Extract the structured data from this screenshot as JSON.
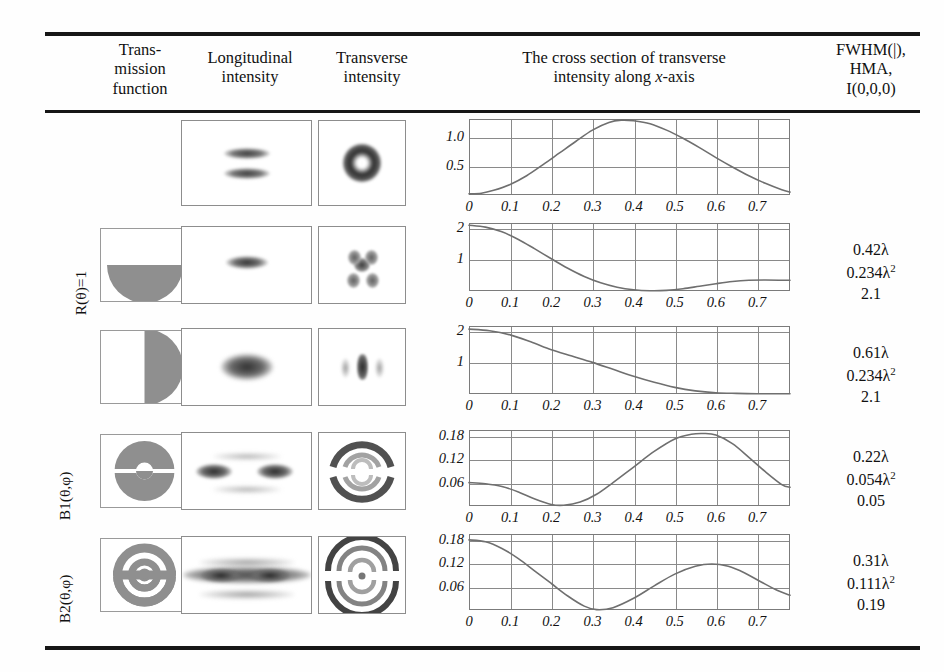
{
  "table": {
    "headers": [
      {
        "id": "transmission",
        "lines": [
          "Trans-",
          "mission",
          "function"
        ]
      },
      {
        "id": "longitudinal",
        "lines": [
          "Longitudinal",
          "intensity"
        ]
      },
      {
        "id": "transverse",
        "lines": [
          "Transverse",
          "intensity"
        ]
      },
      {
        "id": "cross-section",
        "lines": [
          "The cross section of transverse",
          "intensity along  x-axis"
        ]
      },
      {
        "id": "metrics",
        "lines": [
          "FWHM(|),",
          "HMA,",
          "I(0,0,0)"
        ]
      }
    ],
    "row_labels": [
      {
        "id": "r-theta",
        "text": "R(θ)=1",
        "rows": [
          1,
          2
        ]
      },
      {
        "id": "b1",
        "text": "B1(θ,φ)",
        "rows": [
          3
        ]
      },
      {
        "id": "b2",
        "text": "B2(θ,φ)",
        "rows": [
          4
        ]
      }
    ],
    "rows": [
      {
        "id": "row-1",
        "transmission_function": "",
        "longitudinal": "two-horizontal-lobes",
        "transverse": "ring-spot",
        "metrics": {
          "fwhm": "",
          "hma": "",
          "i000": ""
        }
      },
      {
        "id": "row-2",
        "transmission_function": "bottom-semicircle",
        "longitudinal": "single-narrow-lobe",
        "transverse": "four-lobe-cluster",
        "metrics": {
          "fwhm": "0.42λ",
          "hma_base": "0.234λ",
          "hma_exp": "2",
          "i000": "2.1"
        }
      },
      {
        "id": "row-3",
        "transmission_function": "right-semicircle",
        "longitudinal": "single-broad-lobe",
        "transverse": "vertical-bar-spot",
        "metrics": {
          "fwhm": "0.61λ",
          "hma_base": "0.234λ",
          "hma_exp": "2",
          "i000": "2.1"
        }
      },
      {
        "id": "row-4",
        "transmission_function": "split-annulus",
        "longitudinal": "twin-lobes",
        "transverse": "concentric-arcs",
        "metrics": {
          "fwhm": "0.22λ",
          "hma_base": "0.054λ",
          "hma_exp": "2",
          "i000": "0.05"
        }
      },
      {
        "id": "row-5",
        "transmission_function": "split-double-annulus",
        "longitudinal": "broad-twin-lobes",
        "transverse": "concentric-arcs-double",
        "metrics": {
          "fwhm": "0.31λ",
          "hma_base": "0.111λ",
          "hma_exp": "2",
          "i000": "0.19"
        }
      }
    ]
  },
  "chart_data": [
    {
      "id": "chart-row-1",
      "type": "line",
      "title": "",
      "xlabel": "",
      "ylabel": "",
      "xlim": [
        0,
        0.78
      ],
      "ylim": [
        0,
        1.3
      ],
      "xticks": [
        0,
        0.1,
        0.2,
        0.3,
        0.4,
        0.5,
        0.6,
        0.7
      ],
      "xticklabels": [
        "0",
        "0.1",
        "0.2",
        "0.3",
        "0.4",
        "0.5",
        "0.6",
        "0.7"
      ],
      "yticks": [
        0.5,
        1.0
      ],
      "yticklabels": [
        "0.5",
        "1.0"
      ],
      "grid": true,
      "series": [
        {
          "name": "cross-section",
          "x": [
            0.0,
            0.03,
            0.06,
            0.1,
            0.14,
            0.18,
            0.22,
            0.26,
            0.3,
            0.34,
            0.37,
            0.4,
            0.44,
            0.48,
            0.52,
            0.56,
            0.6,
            0.64,
            0.68,
            0.72,
            0.76,
            0.78
          ],
          "y": [
            0.02,
            0.03,
            0.08,
            0.18,
            0.33,
            0.52,
            0.72,
            0.92,
            1.11,
            1.24,
            1.28,
            1.27,
            1.22,
            1.11,
            0.97,
            0.81,
            0.64,
            0.48,
            0.33,
            0.2,
            0.09,
            0.05
          ]
        }
      ]
    },
    {
      "id": "chart-row-2",
      "type": "line",
      "title": "",
      "xlabel": "",
      "ylabel": "",
      "xlim": [
        0,
        0.78
      ],
      "ylim": [
        0,
        2.15
      ],
      "xticks": [
        0,
        0.1,
        0.2,
        0.3,
        0.4,
        0.5,
        0.6,
        0.7
      ],
      "xticklabels": [
        "0",
        "0.1",
        "0.2",
        "0.3",
        "0.4",
        "0.5",
        "0.6",
        "0.7"
      ],
      "yticks": [
        1,
        2
      ],
      "yticklabels": [
        "1",
        "2"
      ],
      "grid": true,
      "series": [
        {
          "name": "cross-section",
          "x": [
            0.0,
            0.04,
            0.08,
            0.12,
            0.16,
            0.2,
            0.24,
            0.28,
            0.32,
            0.36,
            0.4,
            0.44,
            0.48,
            0.52,
            0.56,
            0.6,
            0.64,
            0.68,
            0.72,
            0.78
          ],
          "y": [
            2.08,
            2.02,
            1.87,
            1.63,
            1.33,
            1.02,
            0.72,
            0.46,
            0.26,
            0.12,
            0.04,
            0.01,
            0.02,
            0.07,
            0.15,
            0.23,
            0.3,
            0.34,
            0.35,
            0.34
          ]
        }
      ]
    },
    {
      "id": "chart-row-3",
      "type": "line",
      "title": "",
      "xlabel": "",
      "ylabel": "",
      "xlim": [
        0,
        0.78
      ],
      "ylim": [
        0,
        2.15
      ],
      "xticks": [
        0,
        0.1,
        0.2,
        0.3,
        0.4,
        0.5,
        0.6,
        0.7
      ],
      "xticklabels": [
        "0",
        "0.1",
        "0.2",
        "0.3",
        "0.4",
        "0.5",
        "0.6",
        "0.7"
      ],
      "yticks": [
        1,
        2
      ],
      "yticklabels": [
        "1",
        "2"
      ],
      "grid": true,
      "series": [
        {
          "name": "cross-section",
          "x": [
            0.0,
            0.05,
            0.1,
            0.15,
            0.2,
            0.25,
            0.3,
            0.35,
            0.4,
            0.45,
            0.5,
            0.55,
            0.6,
            0.65,
            0.7,
            0.78
          ],
          "y": [
            2.05,
            2.0,
            1.87,
            1.65,
            1.4,
            1.2,
            1.0,
            0.78,
            0.56,
            0.37,
            0.21,
            0.1,
            0.04,
            0.02,
            0.01,
            0.01
          ]
        }
      ]
    },
    {
      "id": "chart-row-4",
      "type": "line",
      "title": "",
      "xlabel": "",
      "ylabel": "",
      "xlim": [
        0,
        0.78
      ],
      "ylim": [
        0,
        0.195
      ],
      "xticks": [
        0,
        0.1,
        0.2,
        0.3,
        0.4,
        0.5,
        0.6,
        0.7
      ],
      "xticklabels": [
        "0",
        "0.1",
        "0.2",
        "0.3",
        "0.4",
        "0.5",
        "0.6",
        "0.7"
      ],
      "yticks": [
        0.06,
        0.12,
        0.18
      ],
      "yticklabels": [
        "0.06",
        "0.12",
        "0.18"
      ],
      "grid": true,
      "series": [
        {
          "name": "cross-section",
          "x": [
            0.0,
            0.04,
            0.08,
            0.12,
            0.16,
            0.2,
            0.23,
            0.27,
            0.31,
            0.35,
            0.4,
            0.45,
            0.5,
            0.54,
            0.57,
            0.6,
            0.64,
            0.68,
            0.72,
            0.76,
            0.78
          ],
          "y": [
            0.06,
            0.057,
            0.05,
            0.036,
            0.018,
            0.004,
            0.002,
            0.01,
            0.03,
            0.06,
            0.1,
            0.14,
            0.172,
            0.184,
            0.186,
            0.182,
            0.16,
            0.125,
            0.088,
            0.055,
            0.048
          ]
        }
      ]
    },
    {
      "id": "chart-row-5",
      "type": "line",
      "title": "",
      "xlabel": "",
      "ylabel": "",
      "xlim": [
        0,
        0.78
      ],
      "ylim": [
        0,
        0.195
      ],
      "xticks": [
        0,
        0.1,
        0.2,
        0.3,
        0.4,
        0.5,
        0.6,
        0.7
      ],
      "xticklabels": [
        "0",
        "0.1",
        "0.2",
        "0.3",
        "0.4",
        "0.5",
        "0.6",
        "0.7"
      ],
      "yticks": [
        0.06,
        0.12,
        0.18
      ],
      "yticklabels": [
        "0.06",
        "0.12",
        "0.18"
      ],
      "grid": true,
      "series": [
        {
          "name": "cross-section",
          "x": [
            0.0,
            0.04,
            0.08,
            0.12,
            0.16,
            0.2,
            0.24,
            0.28,
            0.31,
            0.35,
            0.4,
            0.45,
            0.5,
            0.55,
            0.59,
            0.63,
            0.67,
            0.71,
            0.75,
            0.78
          ],
          "y": [
            0.18,
            0.175,
            0.158,
            0.132,
            0.1,
            0.068,
            0.036,
            0.01,
            0.001,
            0.006,
            0.03,
            0.062,
            0.092,
            0.112,
            0.118,
            0.112,
            0.095,
            0.072,
            0.05,
            0.038
          ]
        }
      ]
    }
  ]
}
